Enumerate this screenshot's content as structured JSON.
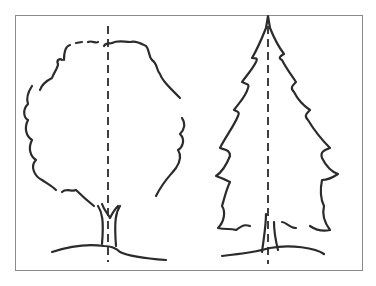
{
  "figure": {
    "frame_color": "#8a8a8a",
    "ink_color": "#2b2b2b",
    "trees": [
      {
        "label": "deciduous tree",
        "shape": "rounded crown",
        "axis": "vertical dashed line"
      },
      {
        "label": "conifer tree",
        "shape": "triangular spruce",
        "axis": "vertical dashed line"
      }
    ]
  }
}
